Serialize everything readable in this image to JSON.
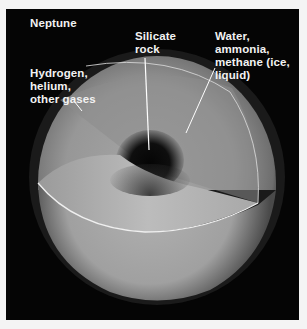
{
  "figure": {
    "title": "Neptune",
    "labels": {
      "outer_layer": "Hydrogen,\nhelium,\nother gases",
      "core": "Silicate\nrock",
      "mantle": "Water, ammonia,\nmethane (ice,\nliquid)"
    },
    "colors": {
      "background": "#050505",
      "frame_border": "#f4f4f4",
      "label_text": "#f2f2f2",
      "pointer_lines": "#ffffff",
      "sphere_light": "#b8b8b8",
      "sphere_mid": "#8a8a8a",
      "core_dark": "#0a0a0a"
    }
  }
}
